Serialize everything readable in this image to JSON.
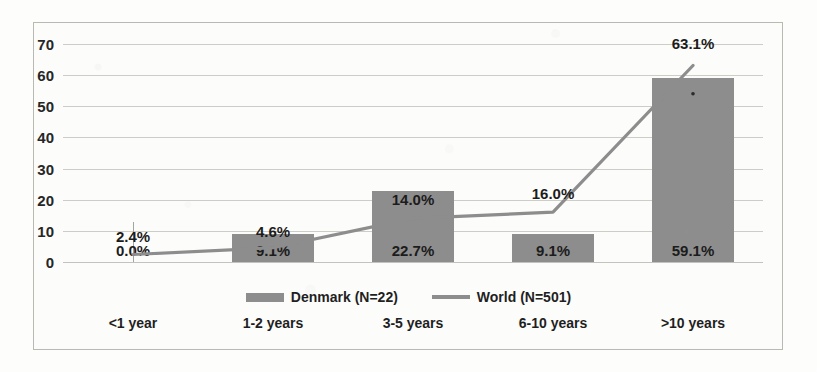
{
  "chart_data": {
    "type": "bar",
    "title": "",
    "xlabel": "",
    "ylabel": "",
    "ylim": [
      0,
      70
    ],
    "ytick_step": 10,
    "yticks": [
      "0",
      "10",
      "20",
      "30",
      "40",
      "50",
      "60",
      "70"
    ],
    "grid": true,
    "legend_position": "bottom",
    "categories": [
      "<1 year",
      "1-2 years",
      "3-5 years",
      "6-10 years",
      ">10 years"
    ],
    "series": [
      {
        "name": "Denmark (N=22)",
        "type": "bar",
        "color": "#8d8d8d",
        "values": [
          0.0,
          9.1,
          22.7,
          9.1,
          59.1
        ],
        "labels": [
          "0.0%",
          "9.1%",
          "22.7%",
          "9.1%",
          "59.1%"
        ]
      },
      {
        "name": "World (N=501)",
        "type": "line",
        "color": "#8d8d8d",
        "values": [
          2.4,
          4.6,
          14.0,
          16.0,
          63.1
        ],
        "labels": [
          "2.4%",
          "4.6%",
          "14.0%",
          "16.0%",
          "63.1%"
        ]
      }
    ]
  },
  "legend": {
    "items": [
      {
        "label": "Denmark (N=22)",
        "swatch": "bar-swatch"
      },
      {
        "label": "World (N=501)",
        "swatch": "line-swatch"
      }
    ]
  },
  "colors": {
    "bar_fill": "#8d8d8d",
    "line_stroke": "#8d8d8d",
    "gridline": "#cdcdc8",
    "frame_border": "#b9b9b4",
    "plot_background": "#fcfcfb",
    "page_background": "#fdfdfc",
    "text": "#1f1f1f"
  }
}
